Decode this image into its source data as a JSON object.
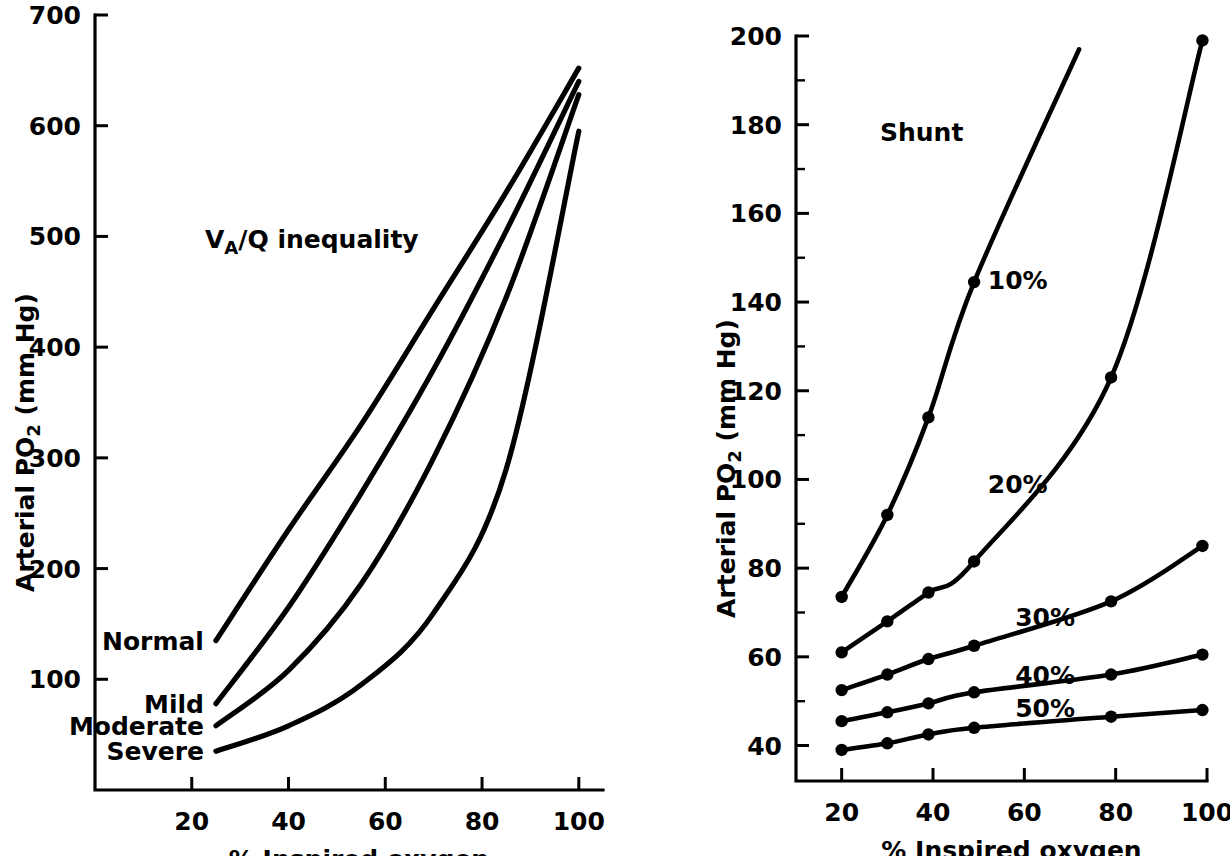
{
  "figure": {
    "background_color": "#ffffff",
    "ink_color": "#000000"
  },
  "chart_data": [
    {
      "id": "va-q-inequality",
      "type": "line",
      "title": "Vₐ/Q inequality",
      "title_plain": "VA/Q inequality",
      "xlabel": "% Inspired oxygen",
      "ylabel": "Arterial PO₂ (mm Hg)",
      "ylabel_plain": "Arterial PO2 (mm Hg)",
      "xlim": [
        0,
        105
      ],
      "ylim": [
        0,
        700
      ],
      "xticks": [
        20,
        40,
        60,
        80,
        100
      ],
      "yticks": [
        100,
        200,
        300,
        400,
        500,
        600,
        700
      ],
      "xminor": [],
      "yminor": [],
      "grid": false,
      "legend": "inline-left-labels",
      "series": [
        {
          "name": "Normal",
          "label": "Normal",
          "label_x": 25,
          "label_y": 135,
          "x": [
            25,
            40,
            55,
            70,
            85,
            100
          ],
          "y": [
            135,
            235,
            330,
            435,
            540,
            652
          ]
        },
        {
          "name": "Mild",
          "label": "Mild",
          "label_x": 25,
          "label_y": 78,
          "x": [
            25,
            40,
            55,
            70,
            85,
            100
          ],
          "y": [
            78,
            165,
            268,
            380,
            505,
            640
          ]
        },
        {
          "name": "Moderate",
          "label": "Moderate",
          "label_x": 25,
          "label_y": 58,
          "x": [
            25,
            40,
            55,
            70,
            85,
            100
          ],
          "y": [
            58,
            108,
            186,
            300,
            445,
            628
          ]
        },
        {
          "name": "Severe",
          "label": "Severe",
          "label_x": 25,
          "label_y": 35,
          "x": [
            25,
            40,
            55,
            70,
            85,
            100
          ],
          "y": [
            35,
            58,
            95,
            160,
            290,
            595
          ]
        }
      ]
    },
    {
      "id": "shunt",
      "type": "line",
      "title": "Shunt",
      "title_plain": "Shunt",
      "xlabel": "% Inspired oxygen",
      "ylabel": "Arterial PO₂ (mm Hg)",
      "ylabel_plain": "Arterial PO2 (mm Hg)",
      "xlim": [
        10,
        100
      ],
      "ylim": [
        32,
        200
      ],
      "xticks": [
        20,
        40,
        60,
        80,
        100
      ],
      "yticks": [
        40,
        60,
        80,
        100,
        120,
        140,
        160,
        180,
        200
      ],
      "yminor": [
        50,
        70,
        90,
        110,
        130,
        150,
        170,
        190
      ],
      "grid": false,
      "legend": "inline-curve-labels",
      "markers": true,
      "series": [
        {
          "name": "10%",
          "label": "10%",
          "label_x": 52,
          "label_y": 145,
          "x": [
            20,
            30,
            39,
            49
          ],
          "y": [
            73.5,
            92,
            114,
            144.5
          ],
          "extend_to": {
            "x": 72,
            "y": 197
          }
        },
        {
          "name": "20%",
          "label": "20%",
          "label_x": 52,
          "label_y": 99,
          "x": [
            20,
            30,
            39,
            49,
            79,
            99
          ],
          "y": [
            61,
            68,
            74.5,
            81.5,
            123,
            199
          ]
        },
        {
          "name": "30%",
          "label": "30%",
          "label_x": 58,
          "label_y": 69,
          "x": [
            20,
            30,
            39,
            49,
            79,
            99
          ],
          "y": [
            52.5,
            56,
            59.5,
            62.5,
            72.5,
            85
          ]
        },
        {
          "name": "40%",
          "label": "40%",
          "label_x": 58,
          "label_y": 56,
          "x": [
            20,
            30,
            39,
            49,
            79,
            99
          ],
          "y": [
            45.5,
            47.5,
            49.5,
            52,
            56,
            60.5
          ]
        },
        {
          "name": "50%",
          "label": "50%",
          "label_x": 58,
          "label_y": 48.5,
          "x": [
            20,
            30,
            39,
            49,
            79,
            99
          ],
          "y": [
            39,
            40.5,
            42.5,
            44,
            46.5,
            48
          ]
        }
      ]
    }
  ]
}
